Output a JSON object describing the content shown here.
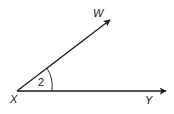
{
  "diagram": {
    "type": "angle",
    "vertex": {
      "label": "X"
    },
    "rays": [
      {
        "label": "W",
        "direction": "upper-right"
      },
      {
        "label": "Y",
        "direction": "right"
      }
    ],
    "angle_label": "2",
    "colors": {
      "stroke": "#1a1a1a",
      "background": "#ffffff"
    }
  }
}
